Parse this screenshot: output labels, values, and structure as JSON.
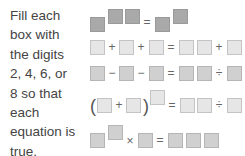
{
  "instructions": "Fill each box with the digits 2, 4, 6, or 8 so that each equation is true.",
  "digits": [
    "2",
    "4",
    "6",
    "8"
  ],
  "equations": [
    {
      "id": "eq1",
      "form": "□^(□□) = □^□",
      "ops": {
        "eq": "="
      }
    },
    {
      "id": "eq2",
      "form": "□ + □ + □ = □□ + □",
      "ops": {
        "plus": "+",
        "eq": "="
      }
    },
    {
      "id": "eq3",
      "form": "□ − □ − □ = □□ ÷ □",
      "ops": {
        "minus": "−",
        "eq": "=",
        "div": "÷"
      }
    },
    {
      "id": "eq4",
      "form": "(□ + □)^□ = □□ ÷ □",
      "ops": {
        "lparen": "(",
        "rparen": ")",
        "plus": "+",
        "eq": "=",
        "div": "÷"
      }
    },
    {
      "id": "eq5",
      "form": "□^□ × □ = □□□",
      "ops": {
        "times": "×",
        "eq": "="
      }
    }
  ]
}
